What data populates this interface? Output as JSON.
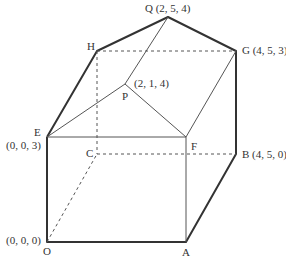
{
  "diagram": {
    "title": "",
    "type": "3D solid: cuboid with triangular prism-like roof",
    "vertices": {
      "O": {
        "label": "O",
        "coords": "(0, 0, 0)"
      },
      "A": {
        "label": "A",
        "coords": ""
      },
      "B": {
        "label": "B",
        "coords": "(4, 5, 0)"
      },
      "C": {
        "label": "C",
        "coords": ""
      },
      "E": {
        "label": "E",
        "coords": "(0, 0, 3)"
      },
      "F": {
        "label": "F",
        "coords": ""
      },
      "G": {
        "label": "G",
        "coords": "(4, 5, 3)"
      },
      "H": {
        "label": "H",
        "coords": ""
      },
      "P": {
        "label": "P",
        "coords": "(2, 1, 4)"
      },
      "Q": {
        "label": "Q",
        "coords": "(2, 5, 4)"
      }
    },
    "labels": {
      "Q_text": "Q (2, 5, 4)",
      "G_text": "G (4, 5, 3)",
      "H_text": "H",
      "P_text": "P",
      "P_coords": "(2, 1, 4)",
      "E_text": "E",
      "E_coords": "(0, 0, 3)",
      "C_text": "C",
      "F_text": "F",
      "B_text": "B (4, 5, 0)",
      "O_coords": "(0, 0, 0)",
      "O_text": "O",
      "A_text": "A"
    },
    "colors": {
      "bold_edge": "#333333",
      "thin_edge": "#555555",
      "hidden_edge": "#555555"
    }
  }
}
